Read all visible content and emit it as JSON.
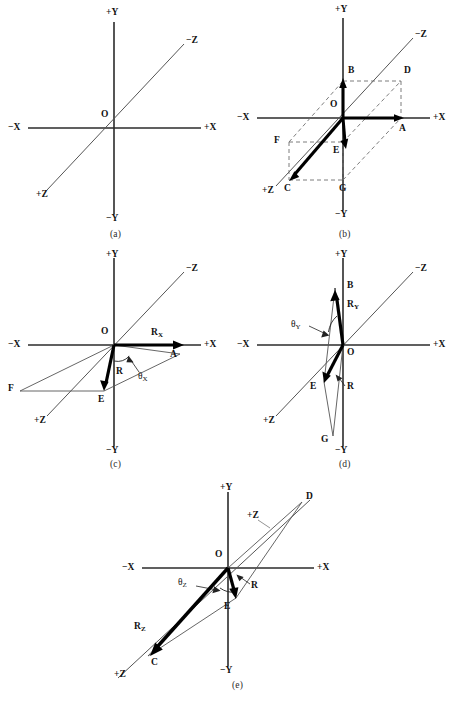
{
  "figure": {
    "kind": "vector-resolution-diagram",
    "panel_count": 5,
    "axis_labels": {
      "x_pos": "+X",
      "x_neg": "−X",
      "y_pos": "+Y",
      "y_neg": "−Y",
      "z_pos": "+Z",
      "z_neg": "−Z"
    },
    "origin_label": "O"
  },
  "panels": [
    {
      "id": "a",
      "caption": "(a)",
      "description": "bare three-axis coordinate system",
      "axis_labels": {
        "x_pos": "+X",
        "x_neg": "−X",
        "y_pos": "+Y",
        "y_neg": "−Y",
        "z_pos": "+Z",
        "z_neg": "−Z"
      },
      "origin_label": "O",
      "points": [],
      "vectors": [],
      "angle_label": ""
    },
    {
      "id": "b",
      "caption": "(b)",
      "description": "resultant R with rectangular box construction",
      "axis_labels": {
        "x_pos": "+X",
        "x_neg": "−X",
        "y_pos": "+Y",
        "y_neg": "−Y",
        "z_pos": "+Z",
        "z_neg": "−Z"
      },
      "origin_label": "O",
      "points": [
        "A",
        "B",
        "C",
        "D",
        "E",
        "F",
        "G"
      ],
      "vectors": [],
      "angle_label": ""
    },
    {
      "id": "c",
      "caption": "(c)",
      "description": "x-component R_x and direction angle theta_x",
      "axis_labels": {
        "x_pos": "+X",
        "x_neg": "−X",
        "y_pos": "+Y",
        "y_neg": "−Y",
        "z_pos": "+Z",
        "z_neg": "−Z"
      },
      "origin_label": "O",
      "points": [
        "A",
        "E",
        "F"
      ],
      "vectors": [
        {
          "name": "Rx",
          "base": "R",
          "subscript": "X"
        },
        {
          "name": "R",
          "base": "R",
          "subscript": ""
        }
      ],
      "angle_label": {
        "base": "θ",
        "subscript": "X"
      }
    },
    {
      "id": "d",
      "caption": "(d)",
      "description": "y-component R_Y and direction angle theta_Y",
      "axis_labels": {
        "x_pos": "+X",
        "x_neg": "−X",
        "y_pos": "+Y",
        "y_neg": "−Y",
        "z_pos": "+Z",
        "z_neg": "−Z"
      },
      "origin_label": "O",
      "points": [
        "B",
        "E",
        "G"
      ],
      "vectors": [
        {
          "name": "Ry",
          "base": "R",
          "subscript": "Y"
        },
        {
          "name": "R",
          "base": "R",
          "subscript": ""
        }
      ],
      "angle_label": {
        "base": "θ",
        "subscript": "Y"
      }
    },
    {
      "id": "e",
      "caption": "(e)",
      "description": "z-component R_Z and direction angle theta_Z",
      "axis_labels": {
        "x_pos": "+X",
        "x_neg": "−X",
        "y_pos": "+Y",
        "y_neg": "−Y",
        "z_pos": "+Z",
        "z_neg": "−Z",
        "z_pos_leader": "+Z"
      },
      "origin_label": "O",
      "points": [
        "C",
        "D",
        "E"
      ],
      "vectors": [
        {
          "name": "Rz",
          "base": "R",
          "subscript": "Z"
        },
        {
          "name": "R",
          "base": "R",
          "subscript": ""
        }
      ],
      "angle_label": {
        "base": "θ",
        "subscript": "Z"
      }
    }
  ],
  "colors": {
    "axis": "#2b2b2b",
    "vector": "#000000",
    "dashed": "#6e6e6e",
    "thin": "#555555",
    "background": "#ffffff"
  }
}
